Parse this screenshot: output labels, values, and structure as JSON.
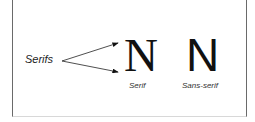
{
  "diagram": {
    "pointer_label": "Serifs",
    "examples": [
      {
        "glyph": "N",
        "caption": "Serif"
      },
      {
        "glyph": "N",
        "caption": "Sans-serif"
      }
    ],
    "colors": {
      "text": "#111111",
      "border": "#6a6a6a",
      "background": "#ffffff"
    }
  }
}
